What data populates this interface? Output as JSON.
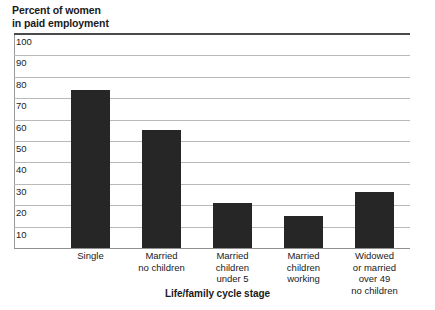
{
  "chart_data": {
    "type": "bar",
    "title": "",
    "ylabel": "Percent of women in paid employment",
    "xlabel": "Life/family cycle stage",
    "ylim": [
      0,
      100
    ],
    "grid": true,
    "legend": "none",
    "ytick_labels": [
      "100",
      "90",
      "80",
      "70",
      "60",
      "50",
      "40",
      "30",
      "20",
      "10"
    ],
    "ytick_values": [
      100,
      90,
      80,
      70,
      60,
      50,
      40,
      30,
      20,
      10
    ],
    "categories": [
      "Single",
      "Married\nno children",
      "Married\nchildren\nunder 5",
      "Married\nchildren\nworking",
      "Widowed\nor married\nover 49\nno children"
    ],
    "values": [
      74,
      55,
      21,
      15,
      26
    ],
    "bar_color": "#262626"
  },
  "axes": {
    "y_title_line1": "Percent of women",
    "y_title_line2": "in paid employment",
    "x_title": "Life/family cycle stage"
  },
  "colors": {
    "bar": "#262626",
    "gridline": "#b9b9b9",
    "top_rule": "#4a4a4a",
    "baseline": "#8f8f8f",
    "text": "#1a1a1a"
  }
}
